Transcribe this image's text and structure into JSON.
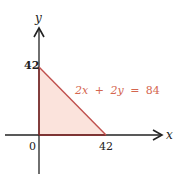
{
  "diagram": {
    "axes": {
      "x_label": "x",
      "y_label": "y",
      "origin_label": "0"
    },
    "ticks": {
      "x_intercept": "42",
      "y_intercept": "42"
    },
    "equation": {
      "lhs_a": "2x",
      "op": "+",
      "lhs_b": "2y",
      "eq": "=",
      "rhs": "84",
      "full": "2x + 2y = 84"
    },
    "region": {
      "vertices": [
        [
          0,
          0
        ],
        [
          42,
          0
        ],
        [
          0,
          42
        ]
      ],
      "fill_color": "#fbe3dc",
      "edge_color": "#c0504d"
    },
    "colors": {
      "axis": "#222222",
      "accent": "#d4664f"
    }
  }
}
